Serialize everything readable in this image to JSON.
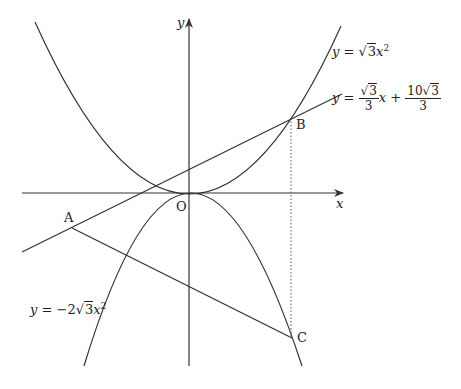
{
  "axes": {
    "x_label": "x",
    "y_label": "y",
    "origin_label": "O"
  },
  "points": [
    {
      "name": "A",
      "px": [
        72,
        228
      ]
    },
    {
      "name": "B",
      "px": [
        291,
        118
      ]
    },
    {
      "name": "C",
      "px": [
        292,
        338
      ]
    }
  ],
  "curves": {
    "upper_parabola": {
      "label": "y = √3x²",
      "prefix": "y = ",
      "root": "3",
      "coef_pre": "",
      "var": "x",
      "exp": "2"
    },
    "lower_parabola": {
      "label": "y = −2√3x²",
      "prefix": "y = −2",
      "root": "3",
      "var": "x",
      "exp": "2"
    },
    "line": {
      "label": "y = (√3/3)x + 10√3/3",
      "prefix": "y = ",
      "f1_num_root": "3",
      "f1_den": "3",
      "mid": "x + ",
      "f2_num_pre": "10",
      "f2_num_root": "3",
      "f2_den": "3"
    }
  },
  "segments": [
    "AB (line)",
    "AC",
    "BC (dotted)"
  ],
  "colors": {
    "stroke": "#333333",
    "background": "#ffffff"
  }
}
